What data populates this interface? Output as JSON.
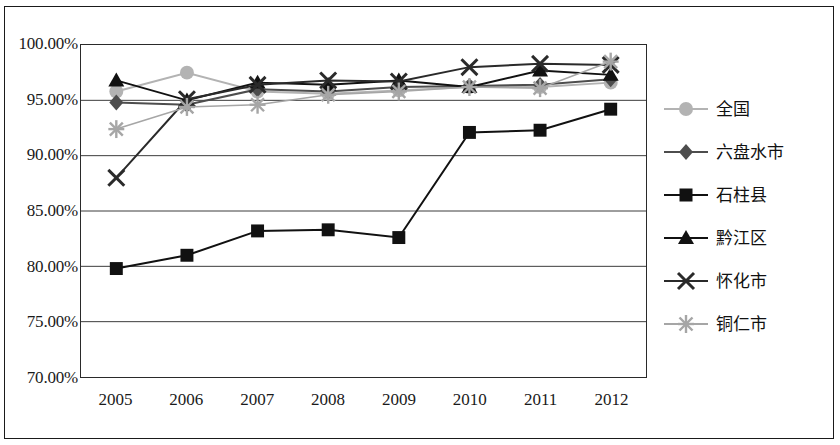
{
  "chart_data": {
    "type": "line",
    "title": "",
    "xlabel": "",
    "ylabel": "",
    "x": [
      "2005",
      "2006",
      "2007",
      "2008",
      "2009",
      "2010",
      "2011",
      "2012"
    ],
    "categories": [
      "2005",
      "2006",
      "2007",
      "2008",
      "2009",
      "2010",
      "2011",
      "2012"
    ],
    "ylim": [
      70.0,
      100.0
    ],
    "ytick_values": [
      100.0,
      95.0,
      90.0,
      85.0,
      80.0,
      75.0,
      70.0
    ],
    "ytick_labels": [
      "100.00%",
      "95.00%",
      "90.00%",
      "85.00%",
      "80.00%",
      "75.00%",
      "70.00%"
    ],
    "grid": true,
    "grid_axis": "y",
    "legend_position": "right",
    "series": [
      {
        "name": "全国",
        "marker": "circle",
        "color": "#b3b3b3",
        "values": [
          95.8,
          97.5,
          95.8,
          95.6,
          95.9,
          96.2,
          96.2,
          96.6
        ]
      },
      {
        "name": "六盘水市",
        "marker": "diamond",
        "color": "#4d4d4d",
        "values": [
          94.8,
          94.6,
          96.0,
          95.8,
          96.2,
          96.3,
          96.4,
          96.9
        ]
      },
      {
        "name": "石柱县",
        "marker": "square",
        "color": "#111111",
        "values": [
          79.8,
          81.0,
          83.2,
          83.3,
          82.6,
          92.1,
          92.3,
          94.2
        ]
      },
      {
        "name": "黔江区",
        "marker": "triangle",
        "color": "#111111",
        "values": [
          96.8,
          95.0,
          96.6,
          96.4,
          96.8,
          96.2,
          97.7,
          97.3
        ]
      },
      {
        "name": "怀化市",
        "marker": "x",
        "color": "#2a2a2a",
        "values": [
          88.0,
          95.1,
          96.4,
          96.8,
          96.7,
          98.0,
          98.3,
          98.2
        ]
      },
      {
        "name": "铜仁市",
        "marker": "star",
        "color": "#a6a6a6",
        "values": [
          92.4,
          94.4,
          94.6,
          95.5,
          95.8,
          96.2,
          96.1,
          98.5
        ]
      }
    ]
  }
}
